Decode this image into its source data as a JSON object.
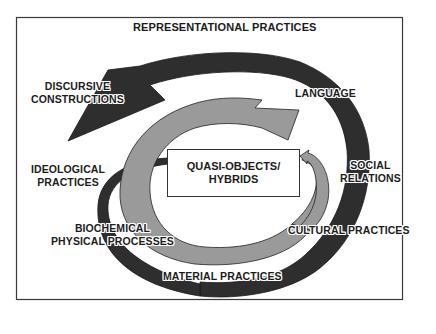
{
  "diagram": {
    "title": "REPRESENTATIONAL PRACTICES",
    "center_box": {
      "line1": "QUASI-OBJECTS/",
      "line2": "HYBRIDS"
    },
    "labels": {
      "discursive_line1": "DISCURSIVE",
      "discursive_line2": "CONSTRUCTIONS",
      "language": "LANGUAGE",
      "ideological_line1": "IDEOLOGICAL",
      "ideological_line2": "PRACTICES",
      "social_line1": "SOCIAL",
      "social_line2": "RELATIONS",
      "biochemical_line1": "BIOCHEMICAL",
      "biochemical_line2": "PHYSICAL PROCESSES",
      "cultural": "CULTURAL PRACTICES",
      "material": "MATERIAL PRACTICES"
    },
    "colors": {
      "dark_arrow": "#2e2e2e",
      "gray_arrow": "#9a9a9a",
      "frame": "#3a3a3a",
      "background": "#ffffff"
    }
  }
}
